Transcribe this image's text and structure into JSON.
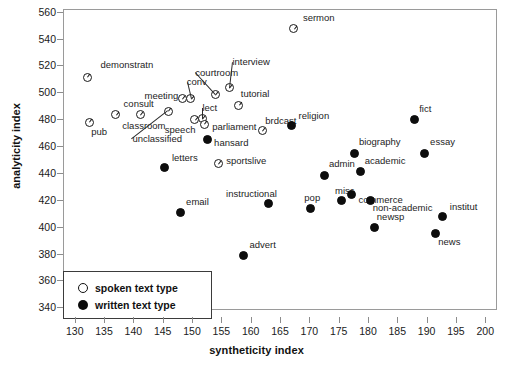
{
  "chart_data": {
    "type": "scatter",
    "title": "",
    "xlabel": "syntheticity index",
    "ylabel": "analyticity index",
    "xlim": [
      128,
      202
    ],
    "ylim": [
      338,
      562
    ],
    "xticks": [
      130,
      135,
      140,
      145,
      150,
      155,
      160,
      165,
      170,
      175,
      180,
      185,
      190,
      195,
      200
    ],
    "yticks": [
      340,
      360,
      380,
      400,
      420,
      440,
      460,
      480,
      500,
      520,
      540,
      560
    ],
    "grid": false,
    "legend_position": "bottom-left",
    "series": [
      {
        "name": "spoken text type",
        "marker": "open-circle",
        "color": "#ffffff",
        "edge_color": "#1a1a1a",
        "points": [
          {
            "label": "demonstratn",
            "x": 132.0,
            "y": 512.0,
            "lx": 13,
            "ly": -12
          },
          {
            "label": "pub",
            "x": 132.3,
            "y": 478.5,
            "lx": 2,
            "ly": 10
          },
          {
            "label": "consult",
            "x": 136.8,
            "y": 484.0,
            "lx": 8,
            "ly": -11
          },
          {
            "label": "classroom",
            "x": 141.0,
            "y": 484.0,
            "lx": -18,
            "ly": 11
          },
          {
            "label": "unclassified",
            "x": 145.8,
            "y": 486.5,
            "lx": -36,
            "ly": 28,
            "leader": true
          },
          {
            "label": "meeting",
            "x": 148.2,
            "y": 495.8,
            "lx": -38,
            "ly": -3
          },
          {
            "label": "conv",
            "x": 149.6,
            "y": 495.8,
            "lx": -4,
            "ly": -17,
            "leader": true
          },
          {
            "label": "speech",
            "x": 150.3,
            "y": 480.5,
            "lx": -30,
            "ly": 10
          },
          {
            "label": "lect",
            "x": 151.6,
            "y": 481.0,
            "lx": 0,
            "ly": -11,
            "leader": true
          },
          {
            "label": "parliament",
            "x": 151.9,
            "y": 477.0,
            "lx": 8,
            "ly": 3
          },
          {
            "label": "courtroom",
            "x": 153.8,
            "y": 499.0,
            "lx": -20,
            "ly": -22,
            "leader": true
          },
          {
            "label": "sportslive",
            "x": 154.3,
            "y": 447.5,
            "lx": 8,
            "ly": -3
          },
          {
            "label": "interview",
            "x": 156.2,
            "y": 504.0,
            "lx": 3,
            "ly": -26,
            "leader": true
          },
          {
            "label": "tutorial",
            "x": 157.8,
            "y": 491.0,
            "lx": 2,
            "ly": -11
          },
          {
            "label": "brdcast",
            "x": 161.8,
            "y": 472.0,
            "lx": 3,
            "ly": -10
          },
          {
            "label": "sermon",
            "x": 167.2,
            "y": 548.0,
            "lx": 9,
            "ly": -11
          }
        ]
      },
      {
        "name": "written text type",
        "marker": "filled-circle",
        "color": "#0d0d0d",
        "points": [
          {
            "label": "letters",
            "x": 145.2,
            "y": 444.5,
            "lx": 7,
            "ly": -10
          },
          {
            "label": "email",
            "x": 147.8,
            "y": 411.0,
            "lx": 6,
            "ly": -11
          },
          {
            "label": "hansard",
            "x": 152.4,
            "y": 466.0,
            "lx": 7,
            "ly": 4
          },
          {
            "label": "advert",
            "x": 158.6,
            "y": 379.5,
            "lx": 6,
            "ly": -10
          },
          {
            "label": "instructional",
            "x": 162.8,
            "y": 418.0,
            "lx": -42,
            "ly": -10
          },
          {
            "label": "religion",
            "x": 166.8,
            "y": 476.0,
            "lx": 7,
            "ly": -10
          },
          {
            "label": "pop",
            "x": 170.0,
            "y": 414.5,
            "lx": -6,
            "ly": -10
          },
          {
            "label": "admin",
            "x": 172.5,
            "y": 439.0,
            "lx": 4,
            "ly": -11
          },
          {
            "label": "misc",
            "x": 175.4,
            "y": 420.0,
            "lx": -7,
            "ly": -10
          },
          {
            "label": "commerce",
            "x": 177.0,
            "y": 424.5,
            "lx": 7,
            "ly": 5
          },
          {
            "label": "biography",
            "x": 177.6,
            "y": 455.5,
            "lx": 4,
            "ly": -11
          },
          {
            "label": "academic",
            "x": 178.6,
            "y": 441.5,
            "lx": 4,
            "ly": -11
          },
          {
            "label": "non-academic",
            "x": 180.3,
            "y": 420.0,
            "lx": 2,
            "ly": 7
          },
          {
            "label": "newsp",
            "x": 181.0,
            "y": 400.5,
            "lx": 2,
            "ly": -10
          },
          {
            "label": "fict",
            "x": 187.7,
            "y": 480.5,
            "lx": 5,
            "ly": -11
          },
          {
            "label": "essay",
            "x": 189.4,
            "y": 455.5,
            "lx": 6,
            "ly": -11
          },
          {
            "label": "institut",
            "x": 192.6,
            "y": 408.0,
            "lx": 7,
            "ly": -10
          },
          {
            "label": "news",
            "x": 191.3,
            "y": 396.0,
            "lx": 3,
            "ly": 9
          }
        ]
      }
    ]
  },
  "legend": {
    "entries": [
      {
        "marker": "open-circle",
        "label": "spoken text type"
      },
      {
        "marker": "filled-circle",
        "label": "written text type"
      }
    ]
  }
}
